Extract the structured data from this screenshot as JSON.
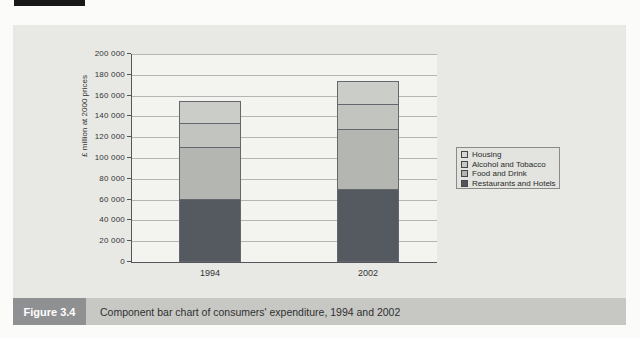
{
  "page": {
    "figure_label": "Figure 3.4",
    "caption": "Component bar chart of consumers' expenditure, 1994 and 2002"
  },
  "colors": {
    "panel_bg": "#e8e9e5",
    "plot_bg": "#f3f3f0",
    "gridline": "#b5b6b2",
    "figure_label_bg": "#8f9092",
    "caption_strip_bg": "#c7c8c4"
  },
  "chart_data": {
    "type": "bar",
    "stacked": true,
    "title": "",
    "xlabel": "",
    "ylabel": "£ million at 2000 prices",
    "ylim": [
      0,
      200000
    ],
    "ytick_interval": 20000,
    "ytick_labels": [
      "0",
      "20 000",
      "40 000",
      "60 000",
      "80 000",
      "100 000",
      "120 000",
      "140 000",
      "160 000",
      "180 000",
      "200 000"
    ],
    "categories": [
      "1994",
      "2002"
    ],
    "series": [
      {
        "name": "Restaurants and Hotels",
        "values": [
          61000,
          70000
        ],
        "color": "#555a61",
        "swatch_color": "#50555b"
      },
      {
        "name": "Food and Drink",
        "values": [
          51000,
          59000
        ],
        "color": "#b4b6b2",
        "swatch_color": "#b2b4b0"
      },
      {
        "name": "Alcohol and Tobacco",
        "values": [
          24000,
          25000
        ],
        "color": "#c2c4c0",
        "swatch_color": "#c6c8c4"
      },
      {
        "name": "Housing",
        "values": [
          22000,
          23000
        ],
        "color": "#cacdc8",
        "swatch_color": "#d6d7d3"
      }
    ],
    "stack_totals": [
      158000,
      177000
    ],
    "legend": [
      "Housing",
      "Alcohol and Tobacco",
      "Food and Drink",
      "Restaurants and Hotels"
    ],
    "legend_position": "right",
    "grid": true
  }
}
